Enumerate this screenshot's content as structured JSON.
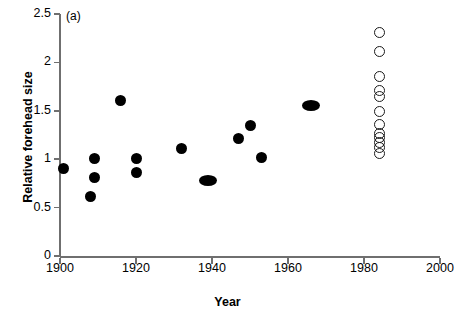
{
  "panel": {
    "label": "(a)"
  },
  "chart_data": {
    "type": "scatter",
    "title": "",
    "xlabel": "Year",
    "ylabel": "Relative forehead size",
    "xlim": [
      1900,
      2000
    ],
    "ylim": [
      0,
      2.5
    ],
    "xticks": [
      1900,
      1920,
      1940,
      1960,
      1980,
      2000
    ],
    "xtick_labels": [
      "1900",
      "1920",
      "1940",
      "1960",
      "1980",
      "2000"
    ],
    "yticks": [
      0,
      0.5,
      1,
      1.5,
      2,
      2.5
    ],
    "ytick_labels": [
      "0",
      "0.5",
      "1",
      "1.5",
      "2",
      "2.5"
    ],
    "grid": false,
    "legend": "none",
    "series": [
      {
        "name": "historical specimens",
        "marker": "filled-circle",
        "color": "#000000",
        "points": [
          {
            "x": 1901,
            "y": 0.9
          },
          {
            "x": 1909,
            "y": 1.01
          },
          {
            "x": 1909,
            "y": 0.81
          },
          {
            "x": 1908,
            "y": 0.61
          },
          {
            "x": 1916,
            "y": 1.61
          },
          {
            "x": 1920,
            "y": 1.01
          },
          {
            "x": 1920,
            "y": 0.86
          },
          {
            "x": 1932,
            "y": 1.11
          },
          {
            "x": 1939,
            "y": 0.78,
            "note": "overlapping pair"
          },
          {
            "x": 1947,
            "y": 1.21
          },
          {
            "x": 1950,
            "y": 1.35
          },
          {
            "x": 1953,
            "y": 1.02
          },
          {
            "x": 1966,
            "y": 1.55,
            "note": "overlapping pair"
          }
        ]
      },
      {
        "name": "modern samples",
        "marker": "open-circle",
        "color": "#1a1a1a",
        "points": [
          {
            "x": 1984,
            "y": 2.31
          },
          {
            "x": 1984,
            "y": 2.11
          },
          {
            "x": 1984,
            "y": 1.85
          },
          {
            "x": 1984,
            "y": 1.71
          },
          {
            "x": 1984,
            "y": 1.65
          },
          {
            "x": 1984,
            "y": 1.49
          },
          {
            "x": 1984,
            "y": 1.36
          },
          {
            "x": 1984,
            "y": 1.27
          },
          {
            "x": 1984,
            "y": 1.22
          },
          {
            "x": 1984,
            "y": 1.17
          },
          {
            "x": 1984,
            "y": 1.12
          },
          {
            "x": 1984,
            "y": 1.06
          }
        ]
      }
    ]
  },
  "axes_pixels": {
    "x0": 60,
    "x1": 440,
    "y0": 256,
    "y1": 14
  }
}
